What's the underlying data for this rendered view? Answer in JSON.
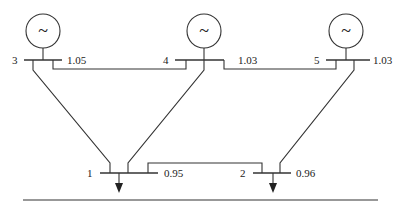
{
  "diagram": {
    "type": "power-system-one-line",
    "buses": [
      {
        "id": "3",
        "label": "3",
        "voltage": "1.05",
        "has_generator": true,
        "generator_symbol": "~"
      },
      {
        "id": "4",
        "label": "4",
        "voltage": "1.03",
        "has_generator": true,
        "generator_symbol": "~"
      },
      {
        "id": "5",
        "label": "5",
        "voltage": "1.03",
        "has_generator": true,
        "generator_symbol": "~"
      },
      {
        "id": "1",
        "label": "1",
        "voltage": "0.95",
        "has_load": true
      },
      {
        "id": "2",
        "label": "2",
        "voltage": "0.96",
        "has_load": true
      }
    ],
    "lines": [
      {
        "from": "3",
        "to": "4"
      },
      {
        "from": "4",
        "to": "5"
      },
      {
        "from": "3",
        "to": "1"
      },
      {
        "from": "4",
        "to": "1"
      },
      {
        "from": "5",
        "to": "2"
      },
      {
        "from": "1",
        "to": "2"
      }
    ],
    "colors": {
      "stroke": "#333333",
      "background": "#ffffff"
    }
  }
}
